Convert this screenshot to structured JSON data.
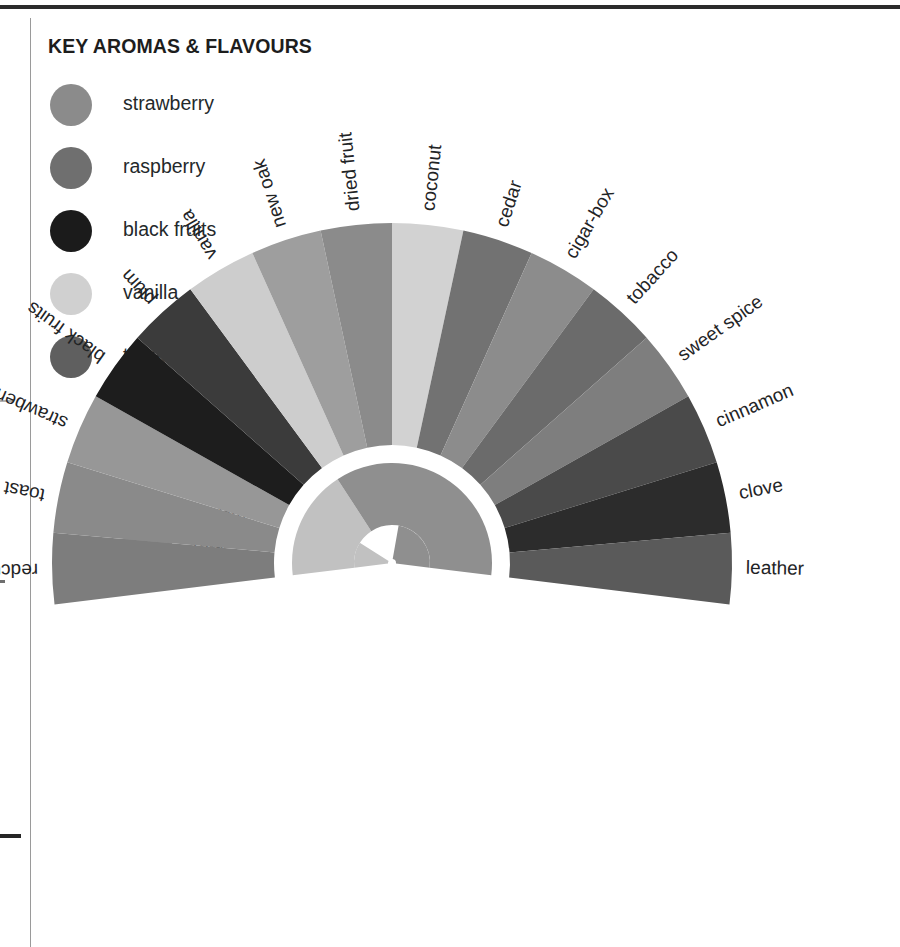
{
  "panel": {
    "title": "KEY AROMAS & FLAVOURS"
  },
  "key": {
    "items": [
      {
        "label": "strawberry",
        "color": "#8b8b8b"
      },
      {
        "label": "raspberry",
        "color": "#6f6f6f"
      },
      {
        "label": "black fruits",
        "color": "#1b1b1b"
      },
      {
        "label": "vanilla",
        "color": "#d0d0d0"
      },
      {
        "label": "tobacco",
        "color": "#5f5f5f"
      }
    ]
  },
  "era_legend": {
    "items": [
      {
        "label": "Modern",
        "color": "#c1c1c1"
      },
      {
        "label": "Traditional",
        "color": "#8f8f8f"
      }
    ]
  },
  "chart_data": {
    "type": "pie",
    "title": "KEY AROMAS & FLAVOURS",
    "subtype": "radial-fan",
    "center": {
      "x": 392,
      "y": 563
    },
    "inner_radius": 118,
    "outer_radius": 340,
    "gap_radius": 18,
    "arc_start_deg": -97,
    "arc_end_deg": 97,
    "legend_position": "left",
    "grid": false,
    "categories": [
      "redcurrant",
      "toast",
      "strawberry",
      "black fruits",
      "plum",
      "vanilla",
      "new oak",
      "dried fruit",
      "coconut",
      "cedar",
      "cigar-box",
      "tobacco",
      "sweet spice",
      "cinnamon",
      "clove",
      "leather"
    ],
    "values": [
      1,
      1,
      1,
      1,
      1,
      1,
      1,
      1,
      1,
      1,
      1,
      1,
      1,
      1,
      1,
      1
    ],
    "slice_colors": [
      "#7d7d7d",
      "#8a8a8a",
      "#979797",
      "#1d1d1d",
      "#3b3b3b",
      "#cdcdcd",
      "#9e9e9e",
      "#8b8b8b",
      "#d2d2d2",
      "#727272",
      "#8c8c8c",
      "#6b6b6b",
      "#7e7e7e",
      "#4a4a4a",
      "#2c2c2c",
      "#5a5a5a"
    ],
    "inner_ring": {
      "segments": [
        {
          "name": "Modern",
          "color": "#c1c1c1",
          "start_deg": -97,
          "end_deg": -33,
          "outer_radius": 118,
          "inner_radius": 48
        },
        {
          "name": "Traditional",
          "color": "#8f8f8f",
          "start_deg": -33,
          "end_deg": 97,
          "outer_radius": 118,
          "inner_radius": 48
        }
      ],
      "overlay": [
        {
          "name": "Modern-extension",
          "color": "#c1c1c1",
          "start_deg": -97,
          "end_deg": -58,
          "outer_radius": 118,
          "inner_radius": 20
        },
        {
          "name": "Traditional-extension",
          "color": "#8f8f8f",
          "start_deg": 10,
          "end_deg": 97,
          "outer_radius": 118,
          "inner_radius": 20
        }
      ]
    },
    "xlabel": "",
    "ylabel": ""
  }
}
